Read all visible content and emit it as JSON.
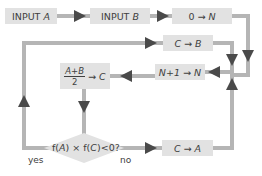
{
  "diagram": {
    "type": "flowchart",
    "colors": {
      "box_fill": "#e2e2e2",
      "connector": "#b5b5b5",
      "arrowhead": "#4a4a4a",
      "text": "#404040",
      "background": "#ffffff"
    },
    "nodes": {
      "input_a": {
        "prefix": "INPUT ",
        "var": "A"
      },
      "input_b": {
        "prefix": "INPUT ",
        "var": "B"
      },
      "init_n": {
        "left": "0",
        "arrow": "→",
        "right": "N"
      },
      "c_to_b": {
        "left": "C",
        "arrow": "→",
        "right": "B"
      },
      "increment_n": {
        "left": "N+1",
        "arrow": "→",
        "right": "N"
      },
      "midpoint": {
        "numerator": "A+B",
        "denominator": "2",
        "arrow": "→",
        "right": "C"
      },
      "decision": {
        "text_pre": "f(",
        "var1": "A",
        "text_mid": ") × f(",
        "var2": "C",
        "text_post": ")<0?"
      },
      "c_to_a": {
        "left": "C",
        "arrow": "→",
        "right": "A"
      }
    },
    "branch_labels": {
      "yes": "yes",
      "no": "no"
    },
    "edges": [
      {
        "from": "INPUT A",
        "to": "INPUT B"
      },
      {
        "from": "INPUT B",
        "to": "0 → N"
      },
      {
        "from": "0 → N",
        "to": "N+1 → N"
      },
      {
        "from": "N+1 → N",
        "to": "(A+B)/2 → C"
      },
      {
        "from": "(A+B)/2 → C",
        "to": "f(A) × f(C)<0?"
      },
      {
        "from": "f(A) × f(C)<0?",
        "to": "C → B",
        "label": "yes"
      },
      {
        "from": "f(A) × f(C)<0?",
        "to": "C → A",
        "label": "no"
      },
      {
        "from": "C → B",
        "to": "N+1 → N"
      },
      {
        "from": "C → A",
        "to": "N+1 → N"
      }
    ]
  }
}
